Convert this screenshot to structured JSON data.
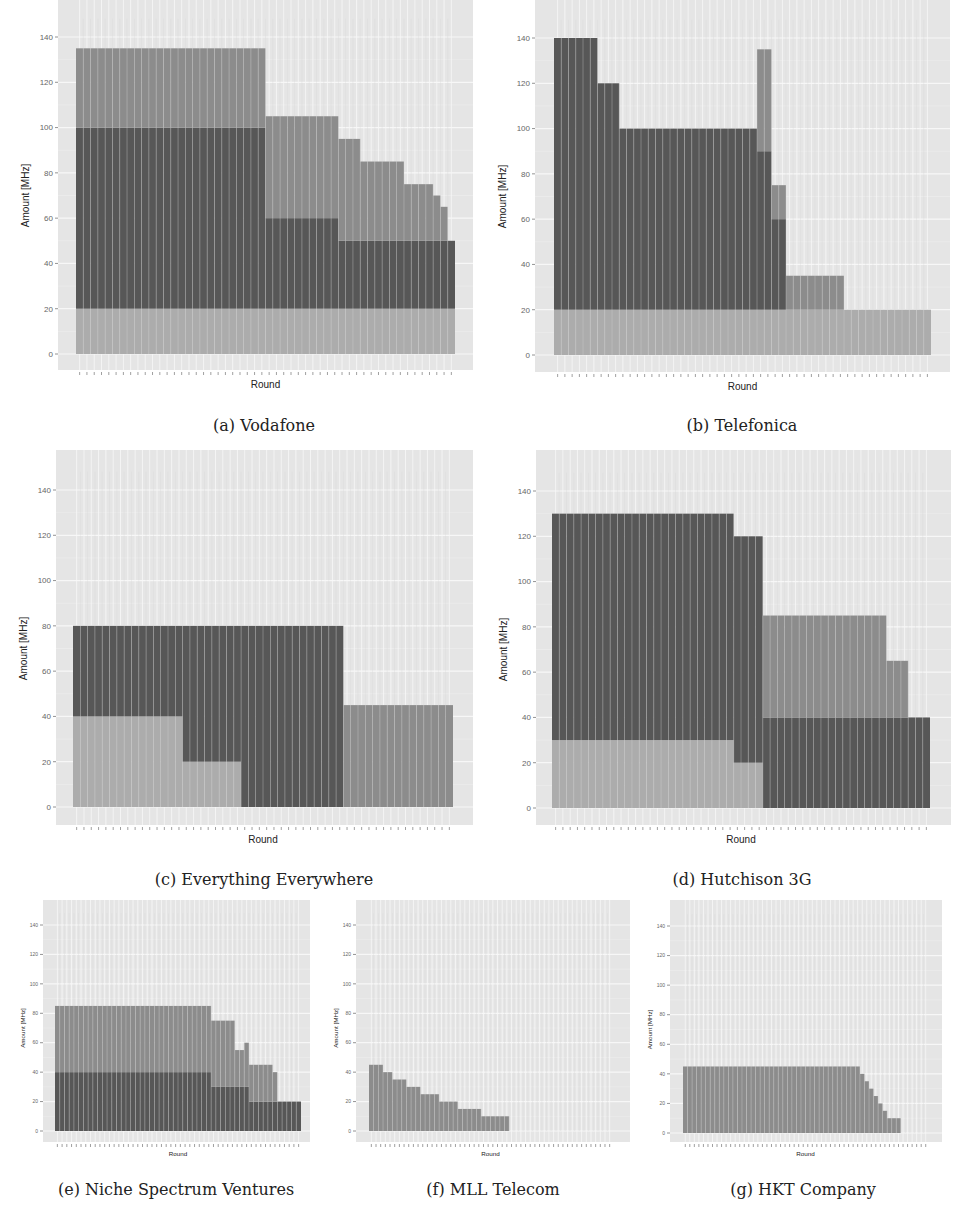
{
  "figure": {
    "colors": {
      "panel_bg": "#e5e5e5",
      "grid": "#f7f7f7",
      "light": "#acacac",
      "dark": "#575757",
      "medium": "#8c8c8c",
      "bar_sep": "#d9d9d9"
    },
    "y_ticks": [
      0,
      20,
      40,
      60,
      80,
      100,
      120,
      140
    ]
  },
  "chart_data": [
    {
      "id": "a",
      "type": "bar",
      "stacked": true,
      "title": "(a) Vodafone",
      "xlabel": "Round",
      "ylabel": "Amount [MHz]",
      "ylim": [
        0,
        148
      ],
      "layout": {
        "panel": [
          58,
          0,
          473,
          370
        ],
        "y0": 354,
        "y140": 37,
        "bars_x": [
          76,
          455
        ],
        "font": 8,
        "caption_xy": [
          264,
          428
        ]
      },
      "runs": [
        {
          "n": 26,
          "segs": [
            [
              "light",
              20
            ],
            [
              "dark",
              80
            ],
            [
              "medium",
              35
            ]
          ]
        },
        {
          "n": 10,
          "segs": [
            [
              "light",
              20
            ],
            [
              "dark",
              40
            ],
            [
              "medium",
              45
            ]
          ]
        },
        {
          "n": 3,
          "segs": [
            [
              "light",
              20
            ],
            [
              "dark",
              30
            ],
            [
              "medium",
              45
            ]
          ]
        },
        {
          "n": 6,
          "segs": [
            [
              "light",
              20
            ],
            [
              "dark",
              30
            ],
            [
              "medium",
              35
            ]
          ]
        },
        {
          "n": 4,
          "segs": [
            [
              "light",
              20
            ],
            [
              "dark",
              30
            ],
            [
              "medium",
              25
            ]
          ]
        },
        {
          "n": 1,
          "segs": [
            [
              "light",
              20
            ],
            [
              "dark",
              30
            ],
            [
              "medium",
              20
            ]
          ]
        },
        {
          "n": 1,
          "segs": [
            [
              "light",
              20
            ],
            [
              "dark",
              30
            ],
            [
              "medium",
              15
            ]
          ]
        },
        {
          "n": 1,
          "segs": [
            [
              "light",
              20
            ],
            [
              "dark",
              30
            ]
          ]
        }
      ]
    },
    {
      "id": "b",
      "type": "bar",
      "stacked": true,
      "title": "(b) Telefonica",
      "xlabel": "Round",
      "ylabel": "Amount [MHz]",
      "ylim": [
        0,
        148
      ],
      "layout": {
        "panel": [
          535,
          0,
          950,
          372
        ],
        "y0": 355,
        "y140": 38,
        "bars_x": [
          554,
          931
        ],
        "font": 8,
        "caption_xy": [
          742,
          428
        ]
      },
      "runs": [
        {
          "n": 6,
          "segs": [
            [
              "light",
              20
            ],
            [
              "dark",
              120
            ]
          ]
        },
        {
          "n": 3,
          "segs": [
            [
              "light",
              20
            ],
            [
              "dark",
              100
            ]
          ]
        },
        {
          "n": 19,
          "segs": [
            [
              "light",
              20
            ],
            [
              "dark",
              80
            ]
          ]
        },
        {
          "n": 2,
          "segs": [
            [
              "light",
              20
            ],
            [
              "dark",
              70
            ],
            [
              "medium",
              45
            ]
          ]
        },
        {
          "n": 2,
          "segs": [
            [
              "light",
              20
            ],
            [
              "dark",
              40
            ],
            [
              "medium",
              15
            ]
          ]
        },
        {
          "n": 8,
          "segs": [
            [
              "light",
              20
            ],
            [
              "medium",
              15
            ]
          ]
        },
        {
          "n": 12,
          "segs": [
            [
              "light",
              20
            ]
          ]
        }
      ]
    },
    {
      "id": "c",
      "type": "bar",
      "stacked": true,
      "title": "(c) Everything Everywhere",
      "xlabel": "Round",
      "ylabel": "Amount [MHz]",
      "ylim": [
        0,
        148
      ],
      "layout": {
        "panel": [
          56,
          450,
          473,
          825
        ],
        "y0": 807,
        "y140": 490,
        "bars_x": [
          73,
          453
        ],
        "font": 8,
        "caption_xy": [
          264,
          882
        ]
      },
      "runs": [
        {
          "n": 15,
          "segs": [
            [
              "light",
              40
            ],
            [
              "dark",
              40
            ]
          ]
        },
        {
          "n": 8,
          "segs": [
            [
              "light",
              20
            ],
            [
              "dark",
              60
            ]
          ]
        },
        {
          "n": 14,
          "segs": [
            [
              "dark",
              80
            ]
          ]
        },
        {
          "n": 15,
          "segs": [
            [
              "medium",
              45
            ]
          ]
        }
      ]
    },
    {
      "id": "d",
      "type": "bar",
      "stacked": true,
      "title": "(d) Hutchison 3G",
      "xlabel": "Round",
      "ylabel": "Amount [MHz]",
      "ylim": [
        0,
        148
      ],
      "layout": {
        "panel": [
          536,
          450,
          951,
          825
        ],
        "y0": 808,
        "y140": 491,
        "bars_x": [
          552,
          930
        ],
        "font": 8,
        "caption_xy": [
          742,
          882
        ]
      },
      "runs": [
        {
          "n": 25,
          "segs": [
            [
              "light",
              30
            ],
            [
              "dark",
              100
            ]
          ]
        },
        {
          "n": 4,
          "segs": [
            [
              "light",
              20
            ],
            [
              "dark",
              100
            ]
          ]
        },
        {
          "n": 17,
          "segs": [
            [
              "dark",
              40
            ],
            [
              "medium",
              45
            ]
          ]
        },
        {
          "n": 3,
          "segs": [
            [
              "dark",
              40
            ],
            [
              "medium",
              25
            ]
          ]
        },
        {
          "n": 3,
          "segs": [
            [
              "dark",
              40
            ]
          ]
        }
      ]
    },
    {
      "id": "e",
      "type": "bar",
      "stacked": true,
      "title": "(e) Niche Spectrum Ventures",
      "xlabel": "Round",
      "ylabel": "Amount [MHz]",
      "ylim": [
        0,
        148
      ],
      "layout": {
        "panel": [
          43,
          900,
          310,
          1142
        ],
        "y0": 1131,
        "y140": 925,
        "bars_x": [
          55,
          301
        ],
        "font": 5,
        "caption_xy": [
          176,
          1192
        ]
      },
      "runs": [
        {
          "n": 33,
          "segs": [
            [
              "dark",
              40
            ],
            [
              "medium",
              45
            ]
          ]
        },
        {
          "n": 5,
          "segs": [
            [
              "dark",
              30
            ],
            [
              "medium",
              45
            ]
          ]
        },
        {
          "n": 2,
          "segs": [
            [
              "dark",
              30
            ],
            [
              "medium",
              25
            ]
          ]
        },
        {
          "n": 1,
          "segs": [
            [
              "dark",
              30
            ],
            [
              "medium",
              30
            ]
          ]
        },
        {
          "n": 5,
          "segs": [
            [
              "dark",
              20
            ],
            [
              "medium",
              25
            ]
          ]
        },
        {
          "n": 1,
          "segs": [
            [
              "dark",
              20
            ],
            [
              "medium",
              20
            ]
          ]
        },
        {
          "n": 5,
          "segs": [
            [
              "dark",
              20
            ]
          ]
        }
      ]
    },
    {
      "id": "f",
      "type": "bar",
      "stacked": true,
      "title": "(f) MLL Telecom",
      "xlabel": "Round",
      "ylabel": "Amount [MHz]",
      "ylim": [
        0,
        148
      ],
      "layout": {
        "panel": [
          356,
          900,
          630,
          1142
        ],
        "y0": 1131,
        "y140": 925,
        "bars_x": [
          369,
          612
        ],
        "font": 5,
        "caption_xy": [
          493,
          1192
        ]
      },
      "runs": [
        {
          "n": 3,
          "segs": [
            [
              "medium",
              45
            ]
          ]
        },
        {
          "n": 2,
          "segs": [
            [
              "medium",
              40
            ]
          ]
        },
        {
          "n": 3,
          "segs": [
            [
              "medium",
              35
            ]
          ]
        },
        {
          "n": 3,
          "segs": [
            [
              "medium",
              30
            ]
          ]
        },
        {
          "n": 4,
          "segs": [
            [
              "medium",
              25
            ]
          ]
        },
        {
          "n": 4,
          "segs": [
            [
              "medium",
              20
            ]
          ]
        },
        {
          "n": 5,
          "segs": [
            [
              "medium",
              15
            ]
          ]
        },
        {
          "n": 6,
          "segs": [
            [
              "medium",
              10
            ]
          ]
        },
        {
          "n": 22,
          "segs": []
        }
      ]
    },
    {
      "id": "g",
      "type": "bar",
      "stacked": true,
      "title": "(g) HKT Company",
      "xlabel": "Round",
      "ylabel": "Amount [MHz]",
      "ylim": [
        0,
        148
      ],
      "layout": {
        "panel": [
          670,
          900,
          942,
          1142
        ],
        "y0": 1133,
        "y140": 926,
        "bars_x": [
          683,
          928
        ],
        "font": 5,
        "caption_xy": [
          803,
          1192
        ]
      },
      "runs": [
        {
          "n": 39,
          "segs": [
            [
              "medium",
              45
            ]
          ]
        },
        {
          "n": 1,
          "segs": [
            [
              "medium",
              40
            ]
          ]
        },
        {
          "n": 1,
          "segs": [
            [
              "medium",
              35
            ]
          ]
        },
        {
          "n": 1,
          "segs": [
            [
              "medium",
              30
            ]
          ]
        },
        {
          "n": 1,
          "segs": [
            [
              "medium",
              25
            ]
          ]
        },
        {
          "n": 1,
          "segs": [
            [
              "medium",
              20
            ]
          ]
        },
        {
          "n": 1,
          "segs": [
            [
              "medium",
              15
            ]
          ]
        },
        {
          "n": 3,
          "segs": [
            [
              "medium",
              10
            ]
          ]
        },
        {
          "n": 6,
          "segs": []
        }
      ]
    }
  ]
}
